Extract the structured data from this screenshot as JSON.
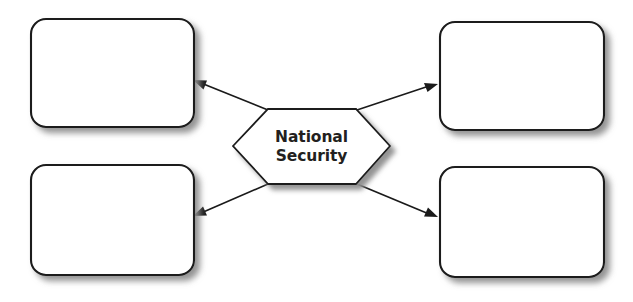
{
  "diagram": {
    "type": "concept-map",
    "canvas": {
      "width": 633,
      "height": 302,
      "background": "#ffffff"
    },
    "palette": {
      "shape_fill": "#ffffff",
      "shape_stroke": "#1a1a1a",
      "text": "#231f20",
      "shadow": "#9a9a9a"
    },
    "center_node": {
      "shape": "hexagon",
      "label_line1": "National",
      "label_line2": "Security",
      "label_full": "National Security"
    },
    "branches": [
      {
        "id": "top-left",
        "label": "",
        "position": "top-left",
        "arrow_direction": "left-up"
      },
      {
        "id": "top-right",
        "label": "",
        "position": "top-right",
        "arrow_direction": "right-up"
      },
      {
        "id": "bottom-left",
        "label": "",
        "position": "bottom-left",
        "arrow_direction": "left-down"
      },
      {
        "id": "bottom-right",
        "label": "",
        "position": "bottom-right",
        "arrow_direction": "right-down"
      }
    ]
  }
}
